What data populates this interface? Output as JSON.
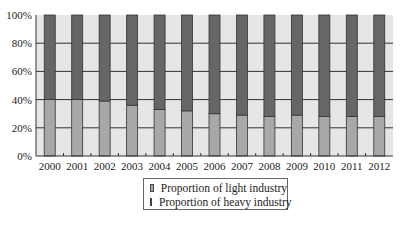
{
  "chart_data": {
    "type": "bar",
    "stacked": true,
    "title": "",
    "xlabel": "",
    "ylabel": "",
    "ylim": [
      0,
      100
    ],
    "yticks": [
      "0%",
      "20%",
      "40%",
      "60%",
      "80%",
      "100%"
    ],
    "grid": true,
    "legend_position": "bottom",
    "categories": [
      "2000",
      "2001",
      "2002",
      "2003",
      "2004",
      "2005",
      "2006",
      "2007",
      "2008",
      "2009",
      "2010",
      "2011",
      "2012"
    ],
    "series": [
      {
        "name": "Proportion of light industry",
        "color": "#a8a8a8",
        "values": [
          40,
          40,
          39,
          36,
          33,
          32,
          30,
          29,
          28,
          29,
          28,
          28,
          28
        ]
      },
      {
        "name": "Proportion of heavy industry",
        "color": "#666666",
        "values": [
          60,
          60,
          61,
          64,
          67,
          68,
          70,
          71,
          72,
          71,
          72,
          72,
          72
        ]
      }
    ]
  },
  "legend": {
    "items": [
      {
        "label": "Proportion of light industry",
        "color": "#a8a8a8"
      },
      {
        "label": "Proportion of heavy industry",
        "color": "#666666"
      }
    ]
  },
  "colors": {
    "plot_bg": "#e6e6e6",
    "grid": "#333333",
    "axis": "#333333"
  }
}
